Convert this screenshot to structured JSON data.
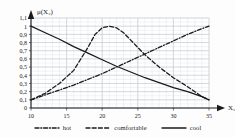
{
  "chart_data": {
    "type": "line",
    "title": "",
    "xlabel": "X₂",
    "ylabel": "μ(X₂)",
    "xlim": [
      10,
      35
    ],
    "ylim": [
      0,
      1.1
    ],
    "grid": true,
    "legend_position": "bottom",
    "xticks": [
      "10",
      "15",
      "20",
      "25",
      "30",
      "35"
    ],
    "xtick_values": [
      10,
      15,
      20,
      25,
      30,
      35
    ],
    "yticks": [
      "0",
      "0,1",
      "0,2",
      "0,3",
      "0,4",
      "0,5",
      "0,6",
      "0,7",
      "0,8",
      "0,9",
      "1",
      "1,1"
    ],
    "ytick_values": [
      0,
      0.1,
      0.2,
      0.3,
      0.4,
      0.5,
      0.6,
      0.7,
      0.8,
      0.9,
      1.0,
      1.1
    ],
    "series": [
      {
        "name": "hot",
        "style": "dash-dot",
        "color": "#1a1a1a",
        "x": [
          10,
          12,
          14,
          16,
          18,
          20,
          22,
          24,
          26,
          28,
          30,
          32,
          34,
          35
        ],
        "values": [
          0.1,
          0.16,
          0.22,
          0.28,
          0.35,
          0.42,
          0.5,
          0.58,
          0.66,
          0.74,
          0.82,
          0.9,
          0.97,
          1.0
        ]
      },
      {
        "name": "comfortable",
        "style": "dashed",
        "color": "#1a1a1a",
        "x": [
          10,
          12,
          14,
          16,
          18,
          19,
          20,
          21,
          22,
          23,
          24,
          26,
          28,
          30,
          32,
          34,
          35
        ],
        "values": [
          0.1,
          0.18,
          0.3,
          0.46,
          0.74,
          0.9,
          0.98,
          1.0,
          0.98,
          0.92,
          0.83,
          0.65,
          0.5,
          0.37,
          0.26,
          0.14,
          0.1
        ]
      },
      {
        "name": "cool",
        "style": "solid",
        "color": "#1a1a1a",
        "x": [
          10,
          12,
          14,
          16,
          18,
          20,
          22,
          24,
          26,
          28,
          30,
          32,
          34,
          35
        ],
        "values": [
          1.0,
          0.92,
          0.84,
          0.75,
          0.67,
          0.59,
          0.51,
          0.44,
          0.37,
          0.31,
          0.25,
          0.2,
          0.14,
          0.1
        ]
      }
    ]
  },
  "legend": {
    "items": [
      {
        "label": "hot",
        "style": "dash-dot"
      },
      {
        "label": "comfortable",
        "style": "dashed"
      },
      {
        "label": "cool",
        "style": "solid"
      }
    ]
  },
  "colors": {
    "ink": "#1a1a1a",
    "grid_minor": "#d8dde2",
    "grid_major": "#c2c9d1",
    "background": "#fdfdfd"
  }
}
